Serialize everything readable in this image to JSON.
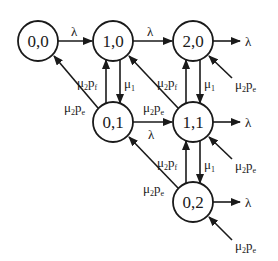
{
  "diagram": {
    "type": "state-transition-diagram",
    "nodes": [
      {
        "id": "n00",
        "label": "0,0"
      },
      {
        "id": "n10",
        "label": "1,0"
      },
      {
        "id": "n20",
        "label": "2,0"
      },
      {
        "id": "n01",
        "label": "0,1"
      },
      {
        "id": "n11",
        "label": "1,1"
      },
      {
        "id": "n02",
        "label": "0,2"
      }
    ],
    "labels": {
      "lambda": "λ",
      "mu": "μ",
      "p": "p",
      "sub1": "1",
      "sub2": "2",
      "subf": "f",
      "sube": "e"
    },
    "edges": [
      {
        "from": "0,0",
        "to": "1,0",
        "label": "λ"
      },
      {
        "from": "1,0",
        "to": "2,0",
        "label": "λ"
      },
      {
        "from": "2,0",
        "to": "out",
        "label": "λ"
      },
      {
        "from": "0,1",
        "to": "1,1",
        "label": "λ"
      },
      {
        "from": "1,1",
        "to": "out",
        "label": "λ"
      },
      {
        "from": "0,2",
        "to": "out",
        "label": "λ"
      },
      {
        "from": "1,0",
        "to": "0,1",
        "label": "μ1"
      },
      {
        "from": "2,0",
        "to": "1,1",
        "label": "μ1"
      },
      {
        "from": "1,1",
        "to": "0,2",
        "label": "μ1"
      },
      {
        "from": "0,1",
        "to": "1,0",
        "label": "μ2pf"
      },
      {
        "from": "1,1",
        "to": "2,0",
        "label": "μ2pf"
      },
      {
        "from": "0,2",
        "to": "1,1",
        "label": "μ2pf"
      },
      {
        "from": "0,1",
        "to": "0,0",
        "label": "μ2pe"
      },
      {
        "from": "1,1",
        "to": "1,0",
        "label": "μ2pe"
      },
      {
        "from": "0,2",
        "to": "0,1",
        "label": "μ2pe"
      },
      {
        "from": "in",
        "to": "2,0",
        "label": "μ2pe"
      },
      {
        "from": "in",
        "to": "1,1",
        "label": "μ2pe"
      },
      {
        "from": "in",
        "to": "0,2",
        "label": "μ2pe"
      }
    ]
  }
}
